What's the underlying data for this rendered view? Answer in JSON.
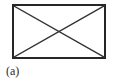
{
  "figure": {
    "caption": "(a)",
    "background_color": "#ffffff",
    "stroke_color": "#262626",
    "diagonal_color": "#333333",
    "frame": {
      "x": 13,
      "y": 5,
      "width": 92,
      "height": 53,
      "border_width": 2.5
    },
    "diagonals": {
      "count": 2,
      "line_width": 1.4,
      "lines": [
        {
          "name": "diagonal-top-left-to-bottom-right",
          "x1": 13,
          "y1": 5,
          "x2": 105,
          "y2": 58
        },
        {
          "name": "diagonal-bottom-left-to-top-right",
          "x1": 13,
          "y1": 58,
          "x2": 105,
          "y2": 5
        }
      ],
      "intersection": {
        "x": 59,
        "y": 31.5
      }
    },
    "shape_name": "rectangle-with-crossed-diagonals"
  }
}
